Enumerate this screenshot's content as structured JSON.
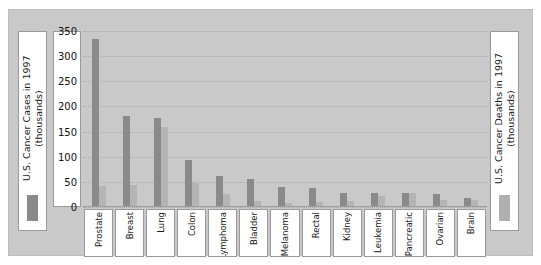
{
  "legend": {
    "left": {
      "label": "U.S. Cancer Cases in 1997\n(thousands)",
      "swatch_color": "#8a8a8a"
    },
    "right": {
      "label": "U.S. Cancer Deaths in 1997\n(thousands)",
      "swatch_color": "#b0b0b0"
    }
  },
  "chart_data": {
    "type": "bar",
    "title": "",
    "xlabel": "",
    "ylabel": "U.S. Cancer Cases in 1997 (thousands)",
    "ylim": [
      0,
      350
    ],
    "yticks": [
      0,
      50,
      100,
      150,
      200,
      250,
      300,
      350
    ],
    "grid": true,
    "legend_position": "outside-left-and-right",
    "categories": [
      "Prostate",
      "Breast",
      "Lung",
      "Colon",
      "Lymphoma",
      "Bladder",
      "Melanoma",
      "Rectal",
      "Kidney",
      "Leukemia",
      "Pancreatic",
      "Ovarian",
      "Brain"
    ],
    "series": [
      {
        "name": "U.S. Cancer Cases in 1997 (thousands)",
        "color": "#8a8a8a",
        "values": [
          334,
          181,
          178,
          94,
          61,
          55,
          40,
          37,
          28,
          28,
          27,
          26,
          17
        ]
      },
      {
        "name": "U.S. Cancer Deaths in 1997 (thousands)",
        "color": "#b4b4b4",
        "values": [
          42,
          44,
          160,
          47,
          25,
          11,
          7,
          9,
          11,
          21,
          28,
          14,
          13
        ]
      }
    ]
  },
  "axis": {
    "tick_labels": [
      "350",
      "300",
      "250",
      "200",
      "150",
      "100",
      "50",
      "0"
    ]
  }
}
